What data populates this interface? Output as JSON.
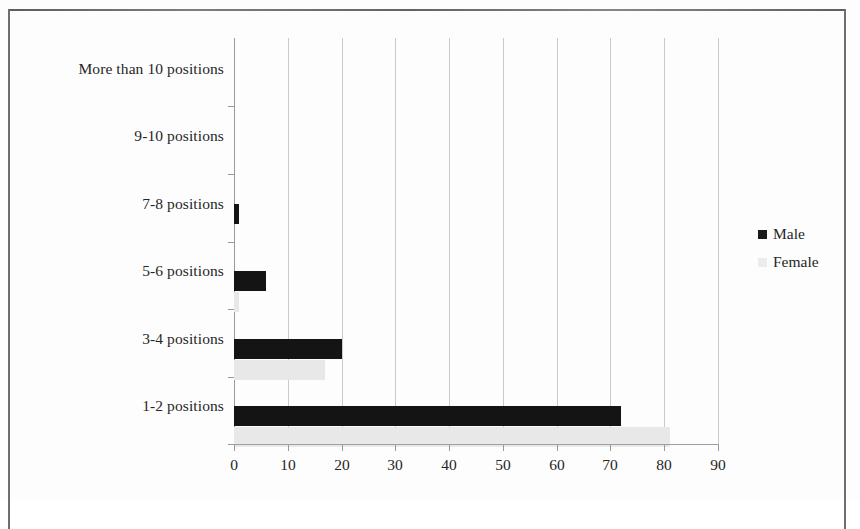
{
  "chart_data": {
    "type": "bar",
    "orientation": "horizontal",
    "title": "",
    "xlabel": "",
    "ylabel": "",
    "xlim": [
      0,
      90
    ],
    "xticks": [
      0,
      10,
      20,
      30,
      40,
      50,
      60,
      70,
      80,
      90
    ],
    "grid": true,
    "legend_position": "right",
    "categories": [
      "1-2 positions",
      "3-4 positions",
      "5-6 positions",
      "7-8 positions",
      "9-10 positions",
      "More than 10 positions"
    ],
    "series": [
      {
        "name": "Male",
        "color": "#141414",
        "values": [
          72,
          20,
          6,
          1,
          0,
          0
        ]
      },
      {
        "name": "Female",
        "color": "#e8e8e8",
        "values": [
          81,
          17,
          1,
          0,
          0,
          0
        ]
      }
    ]
  },
  "legend": {
    "items": [
      {
        "label": "Male",
        "swatch": "male-swatch"
      },
      {
        "label": "Female",
        "swatch": "female-swatch"
      }
    ]
  },
  "axis": {
    "x_tick_labels": [
      "0",
      "10",
      "20",
      "30",
      "40",
      "50",
      "60",
      "70",
      "80",
      "90"
    ],
    "y_tick_labels": [
      "More than 10 positions",
      "9-10 positions",
      "7-8 positions",
      "5-6 positions",
      "3-4 positions",
      "1-2 positions"
    ]
  }
}
